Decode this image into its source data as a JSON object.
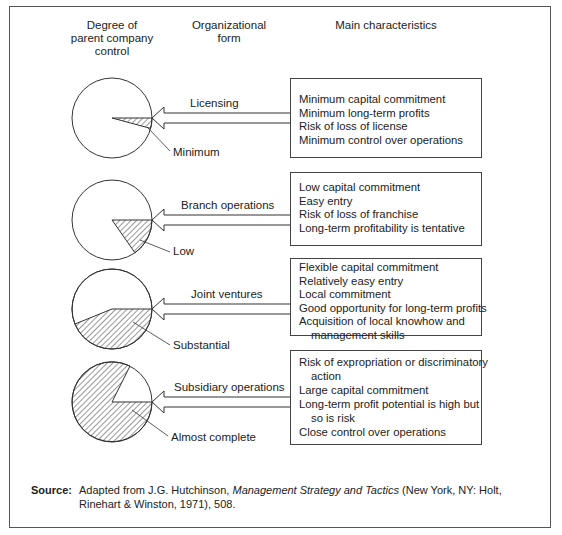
{
  "headers": {
    "control": [
      "Degree of",
      "parent company",
      "control"
    ],
    "form": [
      "Organizational",
      "form"
    ],
    "characteristics": "Main characteristics"
  },
  "rows": [
    {
      "form": "Licensing",
      "control_level": "Minimum",
      "characteristics": [
        {
          "text": "Minimum capital commitment",
          "cont": false
        },
        {
          "text": "Minimum long-term profits",
          "cont": false
        },
        {
          "text": "Risk of loss of license",
          "cont": false
        },
        {
          "text": "Minimum control over operations",
          "cont": false
        }
      ]
    },
    {
      "form": "Branch operations",
      "control_level": "Low",
      "characteristics": [
        {
          "text": "Low capital commitment",
          "cont": false
        },
        {
          "text": "Easy entry",
          "cont": false
        },
        {
          "text": "Risk of loss of franchise",
          "cont": false
        },
        {
          "text": "Long-term profitability is tentative",
          "cont": false
        }
      ]
    },
    {
      "form": "Joint ventures",
      "control_level": "Substantial",
      "characteristics": [
        {
          "text": "Flexible capital commitment",
          "cont": false
        },
        {
          "text": "Relatively easy entry",
          "cont": false
        },
        {
          "text": "Local commitment",
          "cont": false
        },
        {
          "text": "Good opportunity for long-term profits",
          "cont": false
        },
        {
          "text": "Acquisition of local knowhow and",
          "cont": false
        },
        {
          "text": "management skills",
          "cont": true
        }
      ]
    },
    {
      "form": "Subsidiary operations",
      "control_level": "Almost complete",
      "characteristics": [
        {
          "text": "Risk of expropriation or discriminatory",
          "cont": false
        },
        {
          "text": "action",
          "cont": true
        },
        {
          "text": "Large capital commitment",
          "cont": false
        },
        {
          "text": "Long-term profit potential is high but",
          "cont": false
        },
        {
          "text": "so is risk",
          "cont": true
        },
        {
          "text": "Close control over operations",
          "cont": false
        }
      ]
    }
  ],
  "source": {
    "label": "Source:",
    "prefix": "Adapted from J.G. Hutchinson, ",
    "title": "Management Strategy and Tactics",
    "suffix": " (New York, NY: Holt, Rinehart & Winston, 1971), 508."
  }
}
